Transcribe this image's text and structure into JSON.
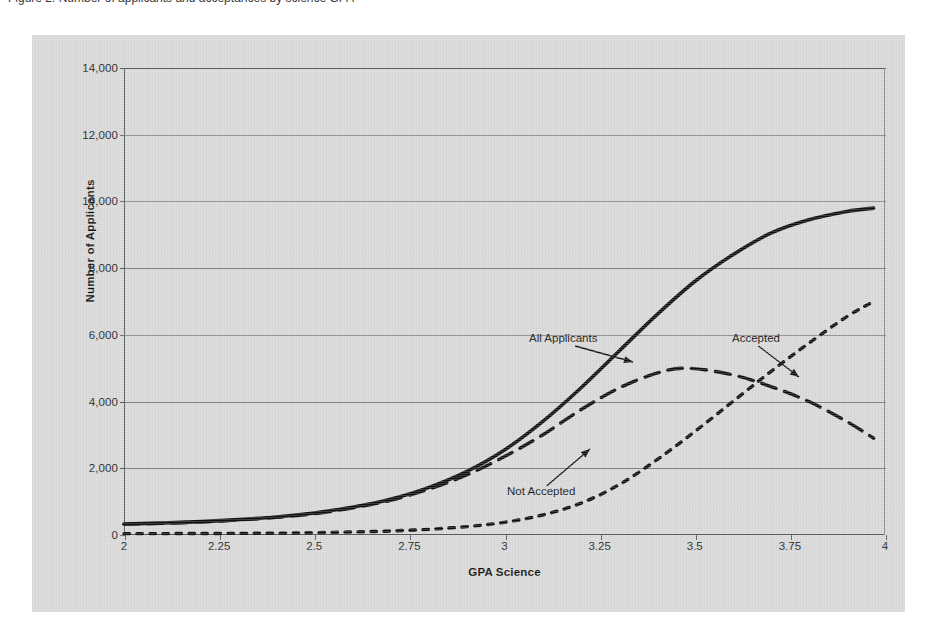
{
  "page": {
    "top_caption": "Figure 2. Number of applicants and acceptances by science GPA"
  },
  "chart_data": {
    "type": "line",
    "title": "",
    "xlabel": "GPA Science",
    "ylabel": "Number of Applicants",
    "xlim": [
      2,
      4
    ],
    "ylim": [
      0,
      14000
    ],
    "grid": true,
    "legend_position": "inline-annotations",
    "x_ticks": [
      "2",
      "2.25",
      "2.5",
      "2.75",
      "3",
      "3.25",
      "3.5",
      "3.75",
      "4"
    ],
    "x_tick_values": [
      2,
      2.25,
      2.5,
      2.75,
      3,
      3.25,
      3.5,
      3.75,
      4
    ],
    "y_ticks": [
      "0",
      "2,000",
      "4,000",
      "6,000",
      "8,000",
      "10,000",
      "12,000",
      "14,000"
    ],
    "y_tick_values": [
      0,
      2000,
      4000,
      6000,
      8000,
      10000,
      12000,
      14000
    ],
    "series": [
      {
        "name": "All Applicants",
        "style": "solid",
        "color": "#111111",
        "x": [
          2.0,
          2.1,
          2.2,
          2.3,
          2.4,
          2.5,
          2.6,
          2.7,
          2.8,
          2.9,
          3.0,
          3.1,
          3.2,
          3.3,
          3.4,
          3.5,
          3.6,
          3.7,
          3.8,
          3.9,
          3.97
        ],
        "values": [
          330,
          360,
          400,
          460,
          540,
          660,
          830,
          1070,
          1420,
          1900,
          2550,
          3400,
          4400,
          5500,
          6600,
          7600,
          8400,
          9050,
          9450,
          9700,
          9800
        ]
      },
      {
        "name": "Not Accepted",
        "style": "dashed",
        "color": "#111111",
        "x": [
          2.0,
          2.1,
          2.2,
          2.3,
          2.4,
          2.5,
          2.6,
          2.7,
          2.8,
          2.9,
          3.0,
          3.1,
          3.2,
          3.3,
          3.4,
          3.48,
          3.6,
          3.7,
          3.8,
          3.9,
          3.97
        ],
        "values": [
          320,
          350,
          390,
          450,
          530,
          640,
          810,
          1040,
          1370,
          1800,
          2350,
          3000,
          3750,
          4400,
          4850,
          5000,
          4800,
          4450,
          4000,
          3400,
          2900
        ]
      },
      {
        "name": "Accepted",
        "style": "dotted",
        "color": "#111111",
        "x": [
          2.0,
          2.2,
          2.4,
          2.5,
          2.6,
          2.7,
          2.8,
          2.9,
          3.0,
          3.1,
          3.2,
          3.3,
          3.4,
          3.5,
          3.6,
          3.7,
          3.8,
          3.9,
          3.97
        ],
        "values": [
          40,
          45,
          55,
          70,
          90,
          120,
          170,
          250,
          380,
          600,
          950,
          1500,
          2250,
          3100,
          4000,
          4900,
          5750,
          6550,
          7000
        ]
      }
    ],
    "annotations": [
      {
        "text": "All Applicants",
        "label_x": 497,
        "label_y": 297,
        "target_x": 601,
        "target_y": 327
      },
      {
        "text": "Accepted",
        "label_x": 700,
        "label_y": 297,
        "target_x": 767,
        "target_y": 342
      },
      {
        "text": "Not Accepted",
        "label_x": 475,
        "label_y": 450,
        "target_x": 558,
        "target_y": 414
      }
    ]
  },
  "colors": {
    "panel_background": "#d9d9d9",
    "page_background": "#ffffff",
    "axis": "#5a5a5a",
    "gridline": "#808080",
    "series_ink": "#111111",
    "text": "#1d1d1d"
  }
}
